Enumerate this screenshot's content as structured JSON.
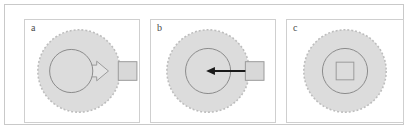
{
  "figure": {
    "panel_count": 3,
    "background_color": "#ffffff",
    "frame_color": "#c9c9c9",
    "panel_border_color": "#cfcfcf"
  },
  "style": {
    "cell_fill": "#dcdcdc",
    "cell_stroke": "#bdbdbd",
    "nucleus_fill": "#dcdcdc",
    "nucleus_stroke": "#8a8a8a",
    "particle_fill": "#d8d8d8",
    "particle_stroke": "#9a9a9a",
    "hollow_arrow_fill": "#e4e4e4",
    "hollow_arrow_stroke": "#9a9a9a",
    "solid_arrow_color": "#1a1a1a"
  },
  "panels": [
    {
      "id": "a",
      "label": "a",
      "cell": {
        "cx": 55,
        "cy": 52,
        "r": 42,
        "outline": "dashed"
      },
      "nucleus": {
        "cx": 47,
        "cy": 52,
        "r": 22
      },
      "particle": {
        "x": 95,
        "y": 42,
        "size": 19
      },
      "arrow": {
        "kind": "hollow-block-arrow",
        "direction": "right",
        "from_x": 47,
        "to_x": 95,
        "y": 52
      }
    },
    {
      "id": "b",
      "label": "b",
      "cell": {
        "cx": 58,
        "cy": 52,
        "r": 42,
        "outline": "dashed"
      },
      "nucleus": {
        "cx": 58,
        "cy": 52,
        "r": 23
      },
      "particle": {
        "x": 96,
        "y": 42,
        "size": 19
      },
      "arrow": {
        "kind": "solid-line-arrow",
        "direction": "left",
        "from_x": 96,
        "to_x": 58,
        "y": 52
      }
    },
    {
      "id": "c",
      "label": "c",
      "cell": {
        "cx": 59,
        "cy": 52,
        "r": 42,
        "outline": "dashed"
      },
      "nucleus": {
        "cx": 59,
        "cy": 52,
        "r": 23
      },
      "particle": {
        "x": 50,
        "y": 43,
        "size": 18
      },
      "arrow": null
    }
  ]
}
